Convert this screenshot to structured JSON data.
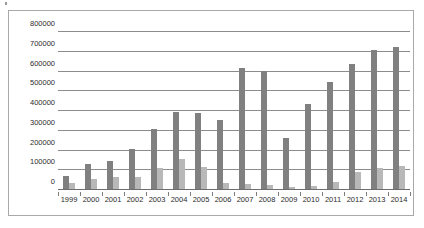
{
  "chart_data": {
    "type": "bar",
    "title": "",
    "subtitle": "",
    "xlabel": "",
    "ylabel": "",
    "ylim": [
      0,
      800000
    ],
    "ytick_values": [
      0,
      100000,
      200000,
      300000,
      400000,
      500000,
      600000,
      700000,
      800000
    ],
    "ytick_labels": [
      "0",
      "100000",
      "200000",
      "300000",
      "400000",
      "500000",
      "600000",
      "700000",
      "800000"
    ],
    "grid": true,
    "legend": "none",
    "categories": [
      "1999",
      "2000",
      "2001",
      "2002",
      "2003",
      "2004",
      "2005",
      "2006",
      "2007",
      "2008",
      "2009",
      "2010",
      "2011",
      "2012",
      "2013",
      "2014"
    ],
    "series": [
      {
        "name": "series-1",
        "color": "#808080",
        "values": [
          70000,
          133000,
          149000,
          208000,
          307000,
          397000,
          389000,
          352000,
          616000,
          605000,
          263000,
          438000,
          547000,
          637000,
          708000,
          722000
        ]
      },
      {
        "name": "series-2",
        "color": "#b8b8b8",
        "values": [
          33000,
          55000,
          68000,
          67000,
          113000,
          155000,
          119000,
          38000,
          29000,
          23000,
          13000,
          22000,
          40000,
          93000,
          109000,
          122000
        ]
      }
    ]
  },
  "frame": {
    "border_color": "#a9a9a9",
    "background": "#ffffff"
  }
}
